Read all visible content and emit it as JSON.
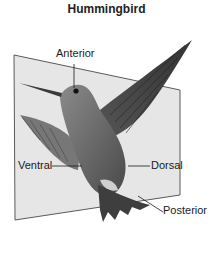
{
  "figure": {
    "title": "Hummingbird",
    "labels": {
      "anterior": "Anterior",
      "ventral": "Ventral",
      "dorsal": "Dorsal",
      "posterior": "Posterior"
    },
    "colors": {
      "plane_fill": "#e6e6e6",
      "plane_stroke": "#5a5a5a",
      "bird_body": "#6e6e6e",
      "bird_dark": "#3e3e3e",
      "leader_line": "#1a1a1a"
    }
  }
}
